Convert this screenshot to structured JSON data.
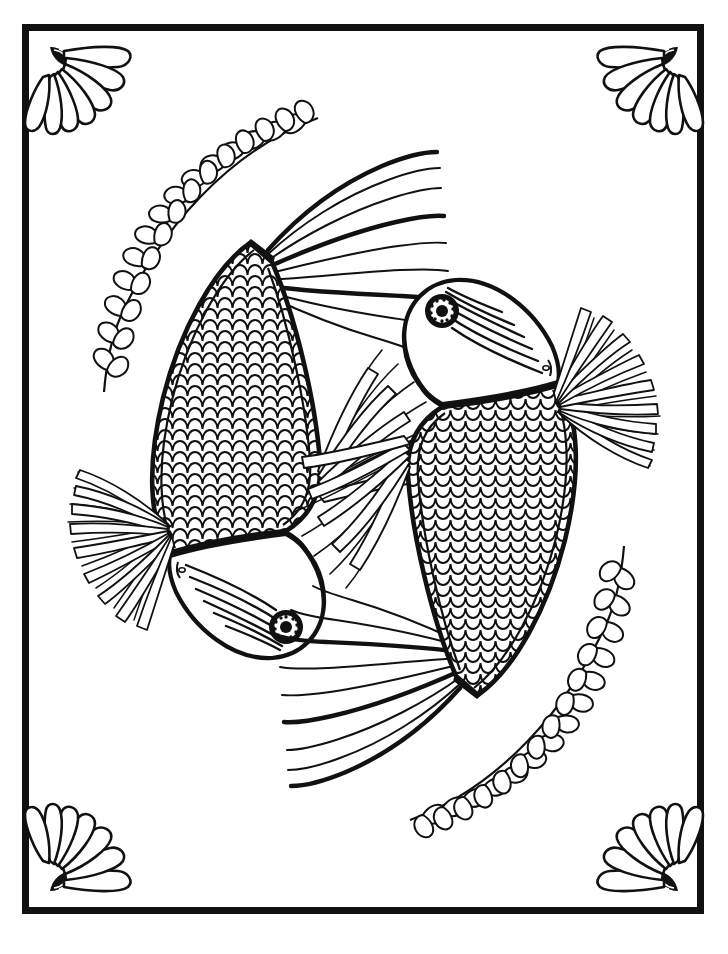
{
  "page": {
    "kind": "coloring-book-page",
    "width": 728,
    "height": 954,
    "background_color": "#ffffff",
    "ink_color": "#111111",
    "scan_guide_line_color": "#cfcfcf",
    "scan_guide_x": 10
  },
  "frame": {
    "name": "rectangular-border",
    "x": 22,
    "y": 24,
    "width": 682,
    "height": 890,
    "stroke_width": 7,
    "stroke_color": "#111111",
    "fill_color": "#ffffff"
  },
  "corner_ornaments": {
    "name": "shell-fan-ornament",
    "count": 4,
    "petal_count": 7,
    "description": "radiating scallop-shell fan with a small striped hinge at the inner pivot",
    "items": [
      {
        "id": "top-left",
        "pivot_x": 48,
        "pivot_y": 45,
        "rotation_deg": 0,
        "flip_x": false,
        "flip_y": false
      },
      {
        "id": "top-right",
        "pivot_x": 680,
        "pivot_y": 45,
        "rotation_deg": 0,
        "flip_x": true,
        "flip_y": false
      },
      {
        "id": "bottom-left",
        "pivot_x": 48,
        "pivot_y": 893,
        "rotation_deg": 0,
        "flip_x": false,
        "flip_y": true
      },
      {
        "id": "bottom-right",
        "pivot_x": 680,
        "pivot_y": 893,
        "rotation_deg": 0,
        "flip_x": true,
        "flip_y": true
      }
    ]
  },
  "vines": {
    "name": "seaweed-vine",
    "count": 2,
    "leaf_shape": "teardrop",
    "leaves_per_node": 2,
    "node_count": 13,
    "items": [
      {
        "id": "upper-left-vine",
        "start_x": 318,
        "start_y": 118,
        "end_x": 104,
        "end_y": 392,
        "bow": "outward-left"
      },
      {
        "id": "lower-right-vine",
        "start_x": 410,
        "start_y": 836,
        "end_x": 624,
        "end_y": 562,
        "bow": "outward-right"
      }
    ]
  },
  "fish": {
    "count": 2,
    "arrangement": "yin-yang / 180-degree rotational symmetry",
    "species_style": "koi / fancy goldfish",
    "parts": [
      "flowing-tail",
      "caudal-peduncle-band",
      "scaled-body",
      "black-gill-band",
      "striped-head",
      "ringed-eye",
      "radiating-pectoral-fin",
      "feathered-dorsal-fin"
    ],
    "items": [
      {
        "id": "fish-lower-left",
        "label": "Fish 1",
        "head_x": 285,
        "head_y": 620,
        "eye_x": 286,
        "eye_y": 627,
        "eye_outer_radius": 16,
        "eye_pupil_radius": 6,
        "eye_dot_count": 12,
        "tail_tip_x": 430,
        "tail_tip_y": 150,
        "body_rotation_deg": 0,
        "scale_rows": 22,
        "scale_cols": 11
      },
      {
        "id": "fish-upper-right",
        "label": "Fish 2",
        "head_x": 443,
        "head_y": 318,
        "eye_x": 452,
        "eye_y": 311,
        "eye_outer_radius": 16,
        "eye_pupil_radius": 6,
        "eye_dot_count": 12,
        "tail_tip_x": 298,
        "tail_tip_y": 788,
        "body_rotation_deg": 180,
        "scale_rows": 22,
        "scale_cols": 11
      }
    ]
  }
}
